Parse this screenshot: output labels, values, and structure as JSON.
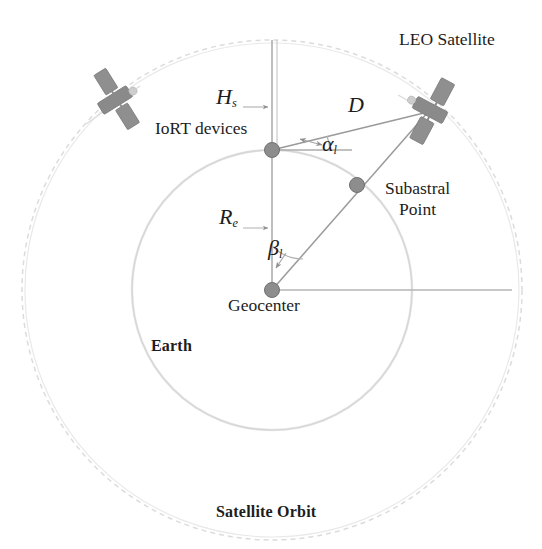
{
  "figure": {
    "type": "satellite-orbit-geometry-diagram"
  },
  "labels": {
    "leo_satellite": "LEO Satellite",
    "iort_devices": "IoRT devices",
    "subastral_point_line1": "Subastral",
    "subastral_point_line2": "Point",
    "geocenter": "Geocenter",
    "earth": "Earth",
    "satellite_orbit": "Satellite Orbit"
  },
  "symbols": {
    "altitude": "H",
    "altitude_sub": "s",
    "earth_radius": "R",
    "earth_radius_sub": "e",
    "slant_distance": "D",
    "elevation_angle": "α",
    "elevation_angle_sub": "l",
    "central_angle": "β",
    "central_angle_sub": "l"
  },
  "colors": {
    "line": "#9a9a9a",
    "faint_line": "#d2d2d2",
    "node": "#8d8d8d",
    "node_edge": "#6f6f6f",
    "satellite_body": "#8a8a8a",
    "satellite_panel": "#8f8f8f",
    "text": "#1d1d1d"
  },
  "geometry": {
    "geocenter": {
      "x": 272,
      "y": 290
    },
    "earth_radius_px": 140,
    "orbit_radius_px": 250,
    "iort_node": {
      "x": 272,
      "y": 150
    },
    "subastral_node": {
      "x": 357,
      "y": 185
    },
    "satellite_primary": {
      "x": 430,
      "y": 110
    },
    "satellite_secondary": {
      "x": 115,
      "y": 100
    },
    "horizontal_ref_end_x": 512
  }
}
